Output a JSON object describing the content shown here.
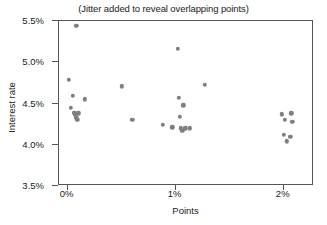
{
  "chart_data": {
    "type": "scatter",
    "title": "(Jitter added to reveal overlapping points)",
    "xlabel": "Points",
    "ylabel": "Interest rate",
    "xlim": [
      -0.08,
      2.28
    ],
    "ylim": [
      3.5,
      5.5
    ],
    "xticks": [
      0,
      1,
      2
    ],
    "xticklabels": [
      "0%",
      "1%",
      "2%"
    ],
    "yticks": [
      3.5,
      4.0,
      4.5,
      5.0,
      5.5
    ],
    "yticklabels": [
      "3.5%",
      "4.0%",
      "4.5%",
      "5.0%",
      "5.5%"
    ],
    "grid": false,
    "legend": false,
    "marker_color": "#7f7f7f",
    "marker_size": 4.4,
    "series": [
      {
        "name": "Loans",
        "x": [
          0.08,
          0.01,
          0.05,
          0.03,
          0.06,
          0.07,
          0.08,
          0.09,
          0.1,
          0.16,
          0.5,
          0.6,
          0.88,
          0.97,
          1.02,
          1.03,
          1.04,
          1.05,
          1.06,
          1.07,
          1.09,
          1.13,
          1.27,
          1.98,
          2.0,
          2.01,
          2.03,
          2.06,
          2.07,
          2.08
        ],
        "y": [
          5.44,
          4.79,
          4.59,
          4.45,
          4.39,
          4.37,
          4.33,
          4.3,
          4.38,
          4.55,
          4.71,
          4.3,
          4.24,
          4.21,
          5.16,
          4.57,
          4.34,
          4.2,
          4.17,
          4.48,
          4.2,
          4.2,
          4.73,
          4.37,
          4.12,
          4.3,
          4.04,
          4.1,
          4.38,
          4.28
        ]
      }
    ]
  }
}
